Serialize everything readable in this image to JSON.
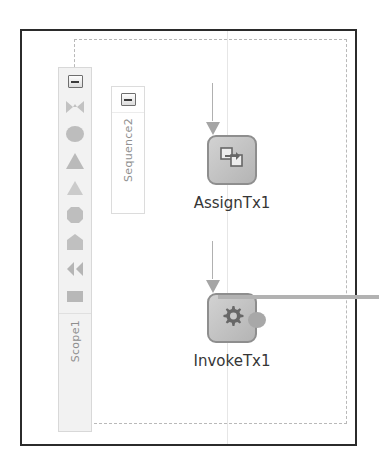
{
  "diagram": {
    "scope": {
      "name": "Scope1",
      "collapse_icon": "collapse-minus-icon"
    },
    "sequence": {
      "name": "Sequence2",
      "collapse_icon": "collapse-minus-icon"
    },
    "palette": {
      "items": [
        {
          "icon": "bowtie-shape-icon"
        },
        {
          "icon": "blob-shape-icon"
        },
        {
          "icon": "triangle-shape-icon"
        },
        {
          "icon": "triangle-outline-shape-icon"
        },
        {
          "icon": "octagon-shape-icon"
        },
        {
          "icon": "pentagon-shape-icon"
        },
        {
          "icon": "double-arrow-shape-icon"
        },
        {
          "icon": "square-shape-icon"
        }
      ]
    },
    "nodes": [
      {
        "id": "assign",
        "label": "AssignTx1",
        "icon": "assign-copy-icon"
      },
      {
        "id": "invoke",
        "label": "InvokeTx1",
        "icon": "gear-icon"
      }
    ],
    "colors": {
      "frame_border": "#2b2b2b",
      "scope_dashed_border": "#b9b9b9",
      "node_fill": "#c4c4c4",
      "node_border": "#8e8e8e",
      "connector": "#a5a5a5",
      "label_text": "#363636",
      "panel_text": "#909090"
    }
  }
}
